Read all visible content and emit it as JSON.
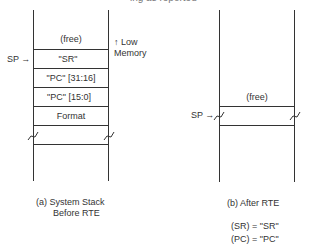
{
  "top_clipped_text": "ing as reported",
  "diagram_a": {
    "rows": [
      {
        "label": "(free)"
      },
      {
        "label": "\"SR\""
      },
      {
        "label": "\"PC\" [31:16]"
      },
      {
        "label": "\"PC\" [15:0]"
      },
      {
        "label": "Format"
      }
    ],
    "sp_label": "SP →",
    "memory_note": {
      "line1": "↑ Low",
      "line2": "Memory"
    },
    "caption": {
      "line1": "(a)  System Stack",
      "line2": "Before RTE"
    }
  },
  "diagram_b": {
    "rows": [
      {
        "label": "(free)"
      }
    ],
    "sp_label": "SP →",
    "caption": "(b)  After RTE",
    "results": [
      {
        "text": "(SR) = \"SR\""
      },
      {
        "text": "(PC) = \"PC\""
      }
    ]
  }
}
